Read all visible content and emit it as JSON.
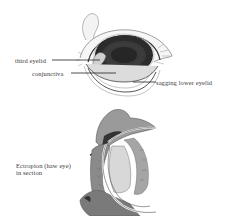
{
  "figure": {
    "top_illustration": {
      "description": "frontal view of eye with sagging lower eyelid",
      "labels": {
        "third_eyelid": "third eyelid",
        "conjunctiva": "conjunctiva",
        "sagging_lower_eyelid": "sagging lower eyelid"
      }
    },
    "bottom_illustration": {
      "description": "sectional view of ectropion",
      "caption_line1": "Ectropion (haw eye)",
      "caption_line2": "in section"
    },
    "colors": {
      "background": "#ffffff",
      "ink": "#2a2a2a",
      "text": "#3a3a3a"
    }
  }
}
